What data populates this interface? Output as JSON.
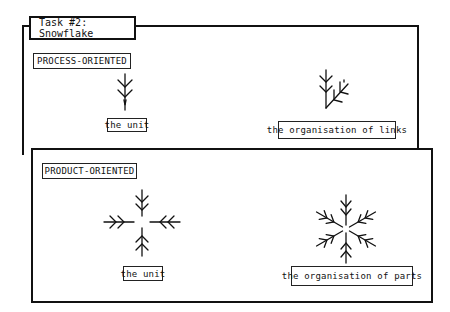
{
  "title": "Task #2: Snowflake",
  "sections": {
    "process": {
      "heading": "PROCESS-ORIENTED",
      "left_caption": "the unit",
      "right_caption": "the organisation of links",
      "left_icon": "single-branch-arm-icon",
      "right_icon": "branching-arms-icon"
    },
    "product": {
      "heading": "PRODUCT-ORIENTED",
      "left_caption": "the unit",
      "right_caption": "the organisation of parts",
      "left_icon": "four-arm-cross-icon",
      "right_icon": "snowflake-icon"
    }
  },
  "colors": {
    "ink": "#111111",
    "background": "#ffffff"
  }
}
